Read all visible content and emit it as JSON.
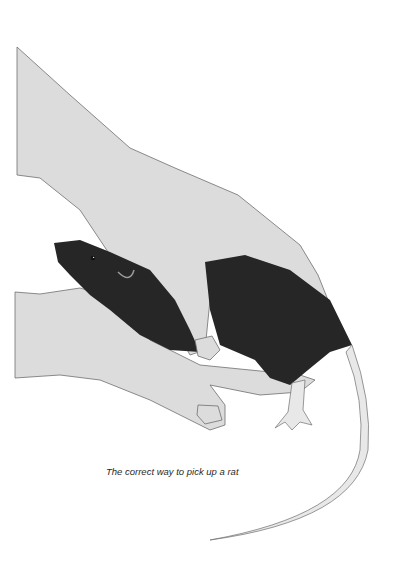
{
  "figure": {
    "caption": "The correct way to pick up a rat",
    "colors": {
      "skin": "#dcdcdc",
      "outline": "#6e6e6e",
      "rat": "#262626",
      "tail": "#e8e8e8",
      "background": "#ffffff"
    }
  }
}
